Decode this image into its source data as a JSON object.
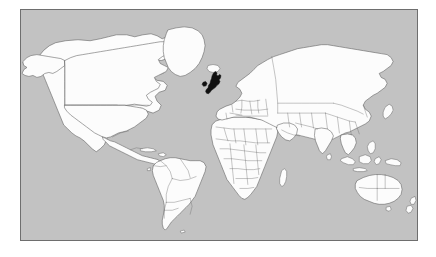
{
  "map": {
    "kind": "world-locator-map",
    "projection": "equirectangular",
    "title": "World map with the United Kingdom highlighted",
    "frame": {
      "x": 20,
      "y": 9,
      "width": 398,
      "height": 232,
      "border_color": "#6e6e6e"
    },
    "colors": {
      "page_background": "#ffffff",
      "ocean": "#c2c2c2",
      "land_fill": "#fcfcfc",
      "coastline_stroke": "#5a5a5a",
      "country_border_stroke": "#6a6a6a",
      "highlight_fill": "#101010"
    },
    "highlighted_regions": [
      {
        "name": "United Kingdom",
        "fill": "#101010"
      }
    ],
    "landmasses": [
      "North America",
      "Greenland",
      "South America",
      "Africa",
      "Europe",
      "Asia",
      "Australia",
      "New Zealand",
      "Indonesia",
      "Japan",
      "Iceland",
      "Madagascar",
      "Papua New Guinea",
      "Philippines",
      "Sri Lanka",
      "Cuba"
    ],
    "features": {
      "country_borders_visible": true,
      "graticule_visible": false,
      "labels_visible": false,
      "legend_visible": false,
      "scale_bar_visible": false,
      "antarctica_visible": false
    }
  }
}
